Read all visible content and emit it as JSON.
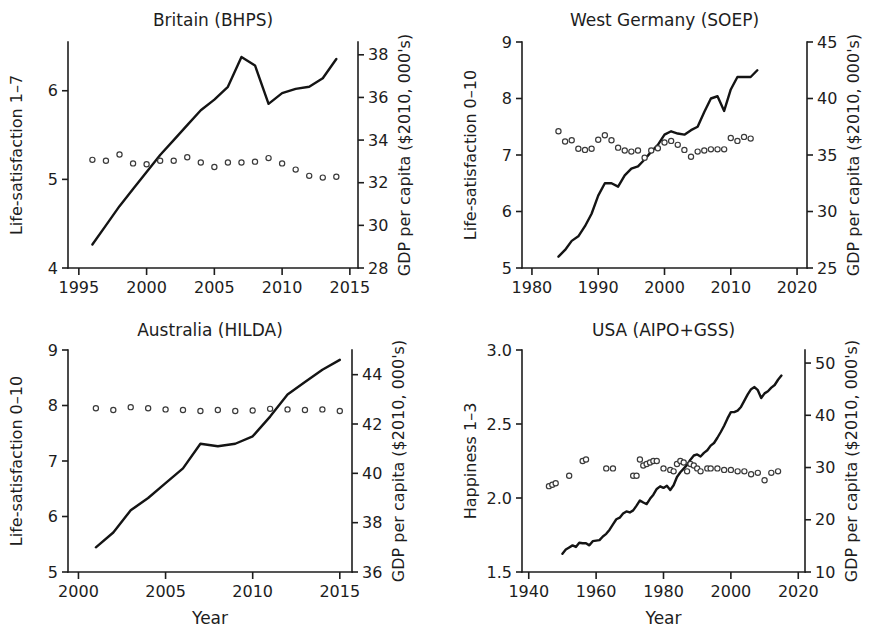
{
  "figure": {
    "width": 895,
    "height": 628,
    "background": "#ffffff",
    "line_color": "#141414",
    "marker_color": "#3a3a3a",
    "text_color": "#1d1d1d"
  },
  "chart_data": [
    {
      "type": "line",
      "panel_id": "britain",
      "title": "Britain (BHPS)",
      "xlabel": "",
      "ylabel": "Life-satisfaction 1–7",
      "y2label": "GDP per capita ($2010, 000's)",
      "xlim": [
        1994.2,
        2015.6
      ],
      "ylim": [
        4,
        6.55
      ],
      "y2lim": [
        28,
        38.6
      ],
      "xticks": [
        1995,
        2000,
        2005,
        2010,
        2015
      ],
      "xticklabels": [
        "1995",
        "2000",
        "2005",
        "2010",
        "2015"
      ],
      "yticks": [
        4,
        5,
        6
      ],
      "yticklabels": [
        "4",
        "5",
        "6"
      ],
      "y2ticks": [
        28,
        30,
        32,
        34,
        36,
        38
      ],
      "y2ticklabels": [
        "28",
        "30",
        "32",
        "34",
        "36",
        "38"
      ],
      "grid": false,
      "legend": "none",
      "series": [
        {
          "name": "GDP per capita",
          "axis": "right",
          "style": "line",
          "x": [
            1996,
            1997,
            1998,
            1999,
            2000,
            2001,
            2002,
            2003,
            2004,
            2005,
            2006,
            2007,
            2008,
            2009,
            2010,
            2011,
            2012,
            2013,
            2014
          ],
          "values": [
            29.1,
            30.0,
            30.9,
            31.7,
            32.5,
            33.3,
            34.0,
            34.7,
            35.4,
            35.9,
            36.5,
            37.9,
            37.5,
            35.7,
            36.2,
            36.4,
            36.5,
            36.9,
            37.8
          ]
        },
        {
          "name": "Life-satisfaction",
          "axis": "left",
          "style": "circles",
          "x": [
            1996,
            1997,
            1998,
            1999,
            2000,
            2001,
            2002,
            2003,
            2004,
            2005,
            2006,
            2007,
            2008,
            2009,
            2010,
            2011,
            2012,
            2013,
            2014
          ],
          "values": [
            5.22,
            5.21,
            5.28,
            5.18,
            5.17,
            5.21,
            5.21,
            5.25,
            5.19,
            5.14,
            5.19,
            5.19,
            5.2,
            5.24,
            5.18,
            5.11,
            5.04,
            5.02,
            5.03
          ]
        }
      ]
    },
    {
      "type": "line",
      "panel_id": "west_germany",
      "title": "West Germany (SOEP)",
      "xlabel": "",
      "ylabel": "Life-satisfaction 0–10",
      "y2label": "GDP per capita ($2010, 000's)",
      "xlim": [
        1978.5,
        2021.5
      ],
      "ylim": [
        5,
        9
      ],
      "y2lim": [
        25,
        45
      ],
      "xticks": [
        1980,
        1990,
        2000,
        2010,
        2020
      ],
      "xticklabels": [
        "1980",
        "1990",
        "2000",
        "2010",
        "2020"
      ],
      "yticks": [
        5,
        6,
        7,
        8,
        9
      ],
      "yticklabels": [
        "5",
        "6",
        "7",
        "8",
        "9"
      ],
      "y2ticks": [
        25,
        30,
        35,
        40,
        45
      ],
      "y2ticklabels": [
        "25",
        "30",
        "35",
        "40",
        "45"
      ],
      "grid": false,
      "legend": "none",
      "series": [
        {
          "name": "GDP per capita",
          "axis": "right",
          "style": "line",
          "x": [
            1984,
            1985,
            1986,
            1987,
            1988,
            1989,
            1990,
            1991,
            1992,
            1993,
            1994,
            1995,
            1996,
            1997,
            1998,
            1999,
            2000,
            2001,
            2002,
            2003,
            2004,
            2005,
            2006,
            2007,
            2008,
            2009,
            2010,
            2011,
            2012,
            2013,
            2014
          ],
          "values": [
            26.0,
            26.6,
            27.4,
            27.8,
            28.7,
            29.8,
            31.4,
            32.5,
            32.5,
            32.2,
            33.2,
            33.8,
            34.0,
            34.6,
            35.3,
            35.9,
            36.8,
            37.1,
            36.9,
            36.8,
            37.2,
            37.5,
            38.8,
            40.0,
            40.2,
            38.9,
            40.8,
            41.9,
            41.9,
            41.9,
            42.5
          ]
        },
        {
          "name": "Life-satisfaction",
          "axis": "left",
          "style": "circles",
          "x": [
            1984,
            1985,
            1986,
            1987,
            1988,
            1989,
            1990,
            1991,
            1992,
            1993,
            1994,
            1995,
            1996,
            1997,
            1998,
            1999,
            2000,
            2001,
            2002,
            2003,
            2004,
            2005,
            2006,
            2007,
            2008,
            2009,
            2010,
            2011,
            2012,
            2013
          ],
          "values": [
            7.42,
            7.24,
            7.26,
            7.11,
            7.09,
            7.11,
            7.27,
            7.35,
            7.26,
            7.13,
            7.08,
            7.06,
            7.08,
            6.95,
            7.08,
            7.12,
            7.22,
            7.25,
            7.18,
            7.09,
            6.97,
            7.06,
            7.08,
            7.1,
            7.1,
            7.1,
            7.3,
            7.25,
            7.32,
            7.29
          ]
        }
      ]
    },
    {
      "type": "line",
      "panel_id": "australia",
      "title": "Australia (HILDA)",
      "xlabel": "Year",
      "ylabel": "Life-satisfaction 0–10",
      "y2label": "GDP per capita ($2010, 000's)",
      "xlim": [
        1999.4,
        2015.7
      ],
      "ylim": [
        5,
        9
      ],
      "y2lim": [
        36,
        45
      ],
      "xticks": [
        2000,
        2005,
        2010,
        2015
      ],
      "xticklabels": [
        "2000",
        "2005",
        "2010",
        "2015"
      ],
      "yticks": [
        5,
        6,
        7,
        8,
        9
      ],
      "yticklabels": [
        "5",
        "6",
        "7",
        "8",
        "9"
      ],
      "y2ticks": [
        36,
        38,
        40,
        42,
        44
      ],
      "y2ticklabels": [
        "36",
        "38",
        "40",
        "42",
        "44"
      ],
      "grid": false,
      "legend": "none",
      "series": [
        {
          "name": "GDP per capita",
          "axis": "right",
          "style": "line",
          "x": [
            2001,
            2002,
            2003,
            2004,
            2005,
            2006,
            2007,
            2008,
            2009,
            2010,
            2011,
            2012,
            2013,
            2014,
            2015
          ],
          "values": [
            37.0,
            37.6,
            38.5,
            39.0,
            39.6,
            40.2,
            41.2,
            41.1,
            41.2,
            41.5,
            42.3,
            43.2,
            43.7,
            44.2,
            44.6
          ]
        },
        {
          "name": "Life-satisfaction",
          "axis": "left",
          "style": "circles",
          "x": [
            2001,
            2002,
            2003,
            2004,
            2005,
            2006,
            2007,
            2008,
            2009,
            2010,
            2011,
            2012,
            2013,
            2014,
            2015
          ],
          "values": [
            7.95,
            7.92,
            7.97,
            7.95,
            7.93,
            7.92,
            7.9,
            7.92,
            7.9,
            7.91,
            7.94,
            7.93,
            7.92,
            7.93,
            7.9
          ]
        }
      ]
    },
    {
      "type": "line",
      "panel_id": "usa",
      "title": "USA (AIPO+GSS)",
      "xlabel": "Year",
      "ylabel": "Happiness 1–3",
      "y2label": "GDP per capita ($2010, 000's)",
      "xlim": [
        1938,
        2022
      ],
      "ylim": [
        1.5,
        3.0
      ],
      "y2lim": [
        10,
        52.5
      ],
      "xticks": [
        1940,
        1960,
        1980,
        2000,
        2020
      ],
      "xticklabels": [
        "1940",
        "1960",
        "1980",
        "2000",
        "2020"
      ],
      "yticks": [
        1.5,
        2.0,
        2.5,
        3.0
      ],
      "yticklabels": [
        "1.5",
        "2.0",
        "2.5",
        "3.0"
      ],
      "y2ticks": [
        10,
        20,
        30,
        40,
        50
      ],
      "y2ticklabels": [
        "10",
        "20",
        "30",
        "40",
        "50"
      ],
      "grid": false,
      "legend": "none",
      "series": [
        {
          "name": "GDP per capita",
          "axis": "right",
          "style": "line",
          "x": [
            1950,
            1951,
            1952,
            1953,
            1954,
            1955,
            1956,
            1957,
            1958,
            1959,
            1960,
            1961,
            1962,
            1963,
            1964,
            1965,
            1966,
            1967,
            1968,
            1969,
            1970,
            1971,
            1972,
            1973,
            1974,
            1975,
            1976,
            1977,
            1978,
            1979,
            1980,
            1981,
            1982,
            1983,
            1984,
            1985,
            1986,
            1987,
            1988,
            1989,
            1990,
            1991,
            1992,
            1993,
            1994,
            1995,
            1996,
            1997,
            1998,
            1999,
            2000,
            2001,
            2002,
            2003,
            2004,
            2005,
            2006,
            2007,
            2008,
            2009,
            2010,
            2011,
            2012,
            2013,
            2014,
            2015
          ],
          "values": [
            13.5,
            14.3,
            14.7,
            15.1,
            14.8,
            15.6,
            15.5,
            15.5,
            15.1,
            15.9,
            16.0,
            16.1,
            16.8,
            17.3,
            18.1,
            19.1,
            20.1,
            20.4,
            21.2,
            21.6,
            21.4,
            21.8,
            22.7,
            23.7,
            23.3,
            23.0,
            24.0,
            24.8,
            25.9,
            26.4,
            26.1,
            26.5,
            25.7,
            26.6,
            28.2,
            29.1,
            29.8,
            30.5,
            31.5,
            32.3,
            32.5,
            32.1,
            32.8,
            33.3,
            34.2,
            34.7,
            35.7,
            36.8,
            38.0,
            39.4,
            40.6,
            40.6,
            40.9,
            41.6,
            42.8,
            44.0,
            45.0,
            45.4,
            44.8,
            43.3,
            44.2,
            44.6,
            45.3,
            45.8,
            46.8,
            47.6
          ]
        },
        {
          "name": "Happiness",
          "axis": "left",
          "style": "circles",
          "x": [
            1946,
            1947,
            1948,
            1952,
            1956,
            1957,
            1963,
            1965,
            1971,
            1972,
            1973,
            1974,
            1975,
            1976,
            1977,
            1978,
            1980,
            1982,
            1983,
            1984,
            1985,
            1986,
            1987,
            1988,
            1989,
            1990,
            1991,
            1993,
            1994,
            1996,
            1998,
            2000,
            2002,
            2004,
            2006,
            2008,
            2010,
            2012,
            2014
          ],
          "values": [
            2.08,
            2.09,
            2.1,
            2.15,
            2.25,
            2.26,
            2.2,
            2.2,
            2.15,
            2.15,
            2.26,
            2.22,
            2.23,
            2.24,
            2.25,
            2.25,
            2.2,
            2.19,
            2.18,
            2.23,
            2.25,
            2.24,
            2.18,
            2.23,
            2.22,
            2.2,
            2.18,
            2.2,
            2.2,
            2.2,
            2.19,
            2.19,
            2.18,
            2.18,
            2.16,
            2.17,
            2.12,
            2.17,
            2.18
          ]
        }
      ]
    }
  ]
}
